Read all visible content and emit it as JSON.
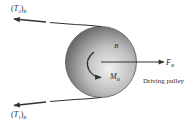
{
  "diagram": {
    "type": "free-body diagram",
    "subject": "Driving pulley",
    "labels": {
      "tension_top": {
        "symbol": "T",
        "index": "2",
        "sub": "B"
      },
      "tension_bottom": {
        "symbol": "T",
        "index": "1",
        "sub": "B"
      },
      "pulley_name": "B",
      "moment": {
        "symbol": "M",
        "sub": "B"
      },
      "force": {
        "symbol": "F",
        "sub": "B"
      },
      "caption": "Driving pulley"
    },
    "colors": {
      "line": "#333333",
      "pulley_dark": "#5a5a5a",
      "pulley_light": "#e8e8e8",
      "background": "#ffffff"
    }
  }
}
